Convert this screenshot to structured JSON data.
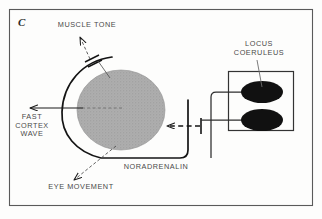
{
  "figure": {
    "panel_letter": "C",
    "border_color": "#555555",
    "circle_fill": "#a9a9a9",
    "nucleus_fill": "#111111",
    "line_color": "#1a1a1a",
    "text_color": "#4a4a4a"
  },
  "labels": {
    "muscle_tone": "MUSCLE TONE",
    "locus_coeruleus": "LOCUS\nCOERULEUS",
    "fast_cortex_wave": "FAST\nCORTEX\nWAVE",
    "noradrenalin": "NORADRENALIN",
    "eye_movement": "EYE MOVEMENT"
  },
  "elements": {
    "central_blob_name": "central-gray-circle",
    "nucleus_upper_name": "locus-coeruleus-nucleus-upper",
    "nucleus_lower_name": "locus-coeruleus-nucleus-lower",
    "nucleus_box_name": "locus-coeruleus-box"
  }
}
